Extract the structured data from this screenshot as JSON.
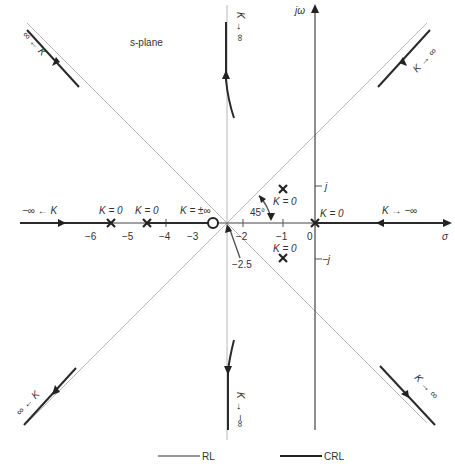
{
  "title": "s-plane",
  "axes": {
    "real_label": "σ",
    "imag_label": "jω",
    "real_ticks": [
      {
        "value": -6,
        "label": "−6"
      },
      {
        "value": -5,
        "label": "−5"
      },
      {
        "value": -4,
        "label": "−4"
      },
      {
        "value": -3,
        "label": "−3"
      },
      {
        "value": -2,
        "label": "−2"
      },
      {
        "value": -1,
        "label": "−1"
      },
      {
        "value": 0,
        "label": "0"
      }
    ],
    "imag_ticks": [
      {
        "value": 1,
        "label": "j"
      },
      {
        "value": -1,
        "label": "−j"
      }
    ]
  },
  "poles": [
    {
      "sigma": -5.5,
      "omega": 0,
      "label": "K = 0"
    },
    {
      "sigma": -4.5,
      "omega": 0,
      "label": "K = 0"
    },
    {
      "sigma": -1,
      "omega": 1,
      "label": "K = 0"
    },
    {
      "sigma": -1,
      "omega": -1,
      "label": "K = 0"
    },
    {
      "sigma": 0,
      "omega": 0,
      "label": "K = 0"
    }
  ],
  "zeros": [
    {
      "sigma": -2.7,
      "omega": 0,
      "label": "K = ±∞"
    }
  ],
  "annotations": {
    "asymptote_center": "−2.5",
    "asymptote_angle": "45°",
    "left_real": "−∞ ← K",
    "right_real": "K → −∞",
    "top_left": "∞ ← K",
    "top_center": "K → ∞",
    "top_right": "K → ∞",
    "bottom_left": "∞ ← K",
    "bottom_center": "K → −∞",
    "bottom_right": "K → ∞"
  },
  "legend": {
    "rl_label": "RL",
    "crl_label": "CRL"
  }
}
